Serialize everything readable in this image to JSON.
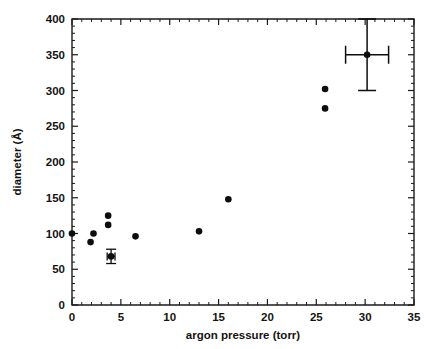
{
  "chart_data": {
    "type": "scatter",
    "title": "",
    "xlabel": "argon pressure (torr)",
    "ylabel": "diameter (Å)",
    "xlim": [
      0,
      35
    ],
    "ylim": [
      0,
      400
    ],
    "xticks": [
      0,
      5,
      10,
      15,
      20,
      25,
      30,
      35
    ],
    "xticklabels": [
      "0",
      "5",
      "10",
      "15",
      "20",
      "25",
      "30",
      "35"
    ],
    "yticks": [
      0,
      50,
      100,
      150,
      200,
      250,
      300,
      350,
      400
    ],
    "yticklabels": [
      "0",
      "50",
      "100",
      "150",
      "200",
      "250",
      "300",
      "350",
      "400"
    ],
    "x_minor_interval": 1,
    "y_minor_interval": 10,
    "grid": false,
    "legend": null,
    "marker": "filled-circle",
    "marker_color": "#0d0d0d",
    "points": [
      {
        "x": 0.0,
        "y": 100,
        "xerr": null,
        "yerr": null
      },
      {
        "x": 1.9,
        "y": 88,
        "xerr": null,
        "yerr": null
      },
      {
        "x": 2.2,
        "y": 100,
        "xerr": null,
        "yerr": null
      },
      {
        "x": 3.7,
        "y": 125,
        "xerr": null,
        "yerr": null
      },
      {
        "x": 3.7,
        "y": 112,
        "xerr": null,
        "yerr": null
      },
      {
        "x": 4.0,
        "y": 68,
        "xerr": 0.4,
        "yerr": 10
      },
      {
        "x": 6.5,
        "y": 96,
        "xerr": null,
        "yerr": null
      },
      {
        "x": 13.0,
        "y": 103,
        "xerr": null,
        "yerr": null
      },
      {
        "x": 16.0,
        "y": 148,
        "xerr": null,
        "yerr": null
      },
      {
        "x": 25.9,
        "y": 302,
        "xerr": null,
        "yerr": null
      },
      {
        "x": 25.9,
        "y": 275,
        "xerr": null,
        "yerr": null
      },
      {
        "x": 30.2,
        "y": 350,
        "xerr": 2.2,
        "yerr": 50
      }
    ]
  },
  "axes": {
    "x_axis_name": "argon pressure axis",
    "y_axis_name": "diameter axis"
  }
}
